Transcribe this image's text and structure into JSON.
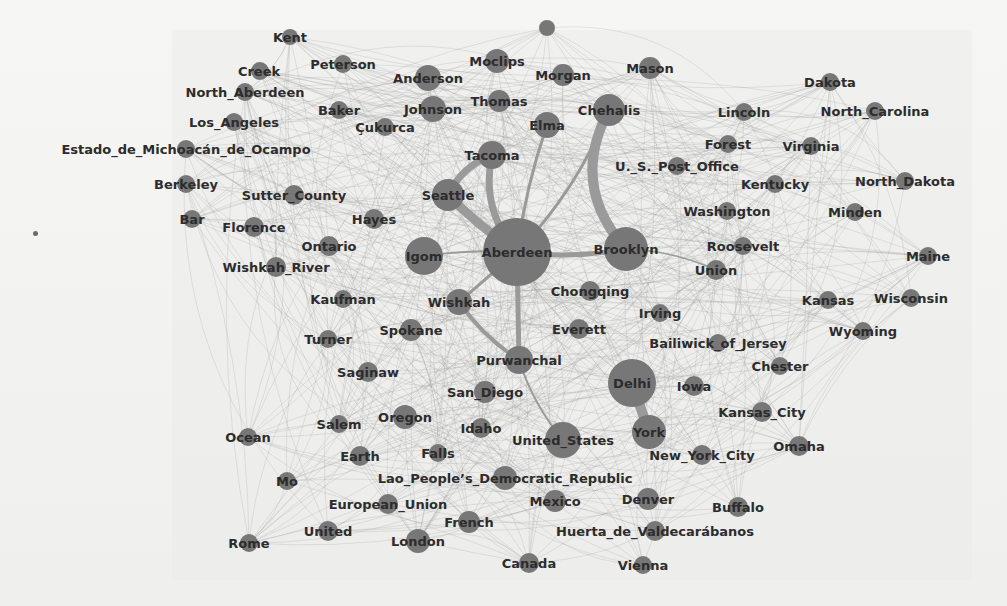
{
  "figure": {
    "type": "network-graph",
    "colors": {
      "node": "#777777",
      "edge": "#9a9a9a",
      "label": "#2c2c2c",
      "background": "#f1f1ef"
    }
  },
  "nodes": [
    {
      "id": "Kent",
      "x": 290,
      "y": 37,
      "r": 8,
      "lx": 290,
      "ly": 42
    },
    {
      "id": "top_unlabeled",
      "x": 547,
      "y": 28,
      "r": 8,
      "lx": 0,
      "ly": 0,
      "hidden_label": true
    },
    {
      "id": "Creek",
      "x": 260,
      "y": 71,
      "r": 9,
      "lx": 259,
      "ly": 76
    },
    {
      "id": "Peterson",
      "x": 343,
      "y": 64,
      "r": 9,
      "lx": 343,
      "ly": 69
    },
    {
      "id": "Anderson",
      "x": 428,
      "y": 78,
      "r": 13,
      "lx": 428,
      "ly": 83
    },
    {
      "id": "Moclips",
      "x": 497,
      "y": 61,
      "r": 12,
      "lx": 497,
      "ly": 66
    },
    {
      "id": "Morgan",
      "x": 563,
      "y": 75,
      "r": 11,
      "lx": 563,
      "ly": 80
    },
    {
      "id": "Mason",
      "x": 650,
      "y": 68,
      "r": 11,
      "lx": 650,
      "ly": 73
    },
    {
      "id": "Dakota",
      "x": 830,
      "y": 82,
      "r": 9,
      "lx": 830,
      "ly": 87
    },
    {
      "id": "North_Aberdeen",
      "x": 245,
      "y": 92,
      "r": 9,
      "lx": 245,
      "ly": 97
    },
    {
      "id": "Baker",
      "x": 339,
      "y": 110,
      "r": 9,
      "lx": 339,
      "ly": 115
    },
    {
      "id": "Johnson",
      "x": 433,
      "y": 109,
      "r": 13,
      "lx": 433,
      "ly": 114
    },
    {
      "id": "Thomas",
      "x": 499,
      "y": 101,
      "r": 11,
      "lx": 499,
      "ly": 106
    },
    {
      "id": "Chehalis",
      "x": 609,
      "y": 110,
      "r": 16,
      "lx": 609,
      "ly": 115
    },
    {
      "id": "Lincoln",
      "x": 744,
      "y": 112,
      "r": 9,
      "lx": 744,
      "ly": 117
    },
    {
      "id": "North_Carolina",
      "x": 875,
      "y": 111,
      "r": 9,
      "lx": 875,
      "ly": 116
    },
    {
      "id": "Los_Angeles",
      "x": 234,
      "y": 122,
      "r": 9,
      "lx": 234,
      "ly": 127
    },
    {
      "id": "Çukurca",
      "x": 385,
      "y": 127,
      "r": 9,
      "lx": 385,
      "ly": 132
    },
    {
      "id": "Elma",
      "x": 547,
      "y": 125,
      "r": 13,
      "lx": 547,
      "ly": 130
    },
    {
      "id": "Forest",
      "x": 728,
      "y": 144,
      "r": 9,
      "lx": 728,
      "ly": 149
    },
    {
      "id": "Virginia",
      "x": 811,
      "y": 146,
      "r": 9,
      "lx": 811,
      "ly": 151
    },
    {
      "id": "Estado_de_Michoacán_de_Ocampo",
      "x": 186,
      "y": 149,
      "r": 9,
      "lx": 186,
      "ly": 154
    },
    {
      "id": "Tacoma",
      "x": 492,
      "y": 155,
      "r": 14,
      "lx": 492,
      "ly": 160
    },
    {
      "id": "U._S._Post_Office",
      "x": 677,
      "y": 166,
      "r": 9,
      "lx": 677,
      "ly": 171
    },
    {
      "id": "Berkeley",
      "x": 186,
      "y": 184,
      "r": 9,
      "lx": 186,
      "ly": 189
    },
    {
      "id": "Kentucky",
      "x": 775,
      "y": 184,
      "r": 9,
      "lx": 775,
      "ly": 189
    },
    {
      "id": "North_Dakota",
      "x": 905,
      "y": 181,
      "r": 9,
      "lx": 905,
      "ly": 186
    },
    {
      "id": "Sutter_County",
      "x": 294,
      "y": 195,
      "r": 10,
      "lx": 294,
      "ly": 200
    },
    {
      "id": "Seattle",
      "x": 448,
      "y": 195,
      "r": 16,
      "lx": 448,
      "ly": 200
    },
    {
      "id": "Washington",
      "x": 727,
      "y": 211,
      "r": 9,
      "lx": 727,
      "ly": 216
    },
    {
      "id": "Minden",
      "x": 855,
      "y": 212,
      "r": 9,
      "lx": 855,
      "ly": 217
    },
    {
      "id": "Bar",
      "x": 192,
      "y": 219,
      "r": 9,
      "lx": 192,
      "ly": 224
    },
    {
      "id": "Florence",
      "x": 254,
      "y": 227,
      "r": 10,
      "lx": 254,
      "ly": 232
    },
    {
      "id": "Hayes",
      "x": 374,
      "y": 219,
      "r": 10,
      "lx": 374,
      "ly": 224
    },
    {
      "id": "Ontario",
      "x": 329,
      "y": 246,
      "r": 10,
      "lx": 329,
      "ly": 251
    },
    {
      "id": "Igom",
      "x": 424,
      "y": 256,
      "r": 19,
      "lx": 424,
      "ly": 261
    },
    {
      "id": "Aberdeen",
      "x": 517,
      "y": 252,
      "r": 34,
      "lx": 517,
      "ly": 257
    },
    {
      "id": "Brooklyn",
      "x": 626,
      "y": 249,
      "r": 22,
      "lx": 626,
      "ly": 254
    },
    {
      "id": "Roosevelt",
      "x": 743,
      "y": 246,
      "r": 9,
      "lx": 743,
      "ly": 251
    },
    {
      "id": "Maine",
      "x": 928,
      "y": 256,
      "r": 9,
      "lx": 928,
      "ly": 261
    },
    {
      "id": "Wishkah_River",
      "x": 276,
      "y": 267,
      "r": 10,
      "lx": 276,
      "ly": 272
    },
    {
      "id": "Union",
      "x": 716,
      "y": 270,
      "r": 10,
      "lx": 716,
      "ly": 275
    },
    {
      "id": "Chongqing",
      "x": 590,
      "y": 291,
      "r": 10,
      "lx": 590,
      "ly": 296
    },
    {
      "id": "Kaufman",
      "x": 343,
      "y": 299,
      "r": 9,
      "lx": 343,
      "ly": 304
    },
    {
      "id": "Wishkah",
      "x": 459,
      "y": 302,
      "r": 13,
      "lx": 459,
      "ly": 307
    },
    {
      "id": "Kansas",
      "x": 828,
      "y": 300,
      "r": 9,
      "lx": 828,
      "ly": 305
    },
    {
      "id": "Wisconsin",
      "x": 911,
      "y": 298,
      "r": 9,
      "lx": 911,
      "ly": 303
    },
    {
      "id": "Irving",
      "x": 660,
      "y": 313,
      "r": 9,
      "lx": 660,
      "ly": 318
    },
    {
      "id": "Turner",
      "x": 328,
      "y": 339,
      "r": 9,
      "lx": 328,
      "ly": 344
    },
    {
      "id": "Spokane",
      "x": 411,
      "y": 330,
      "r": 11,
      "lx": 411,
      "ly": 335
    },
    {
      "id": "Everett",
      "x": 579,
      "y": 329,
      "r": 10,
      "lx": 579,
      "ly": 334
    },
    {
      "id": "Wyoming",
      "x": 863,
      "y": 331,
      "r": 9,
      "lx": 863,
      "ly": 336
    },
    {
      "id": "Bailiwick_of_Jersey",
      "x": 718,
      "y": 343,
      "r": 9,
      "lx": 718,
      "ly": 348
    },
    {
      "id": "Purwanchal",
      "x": 519,
      "y": 360,
      "r": 14,
      "lx": 519,
      "ly": 365
    },
    {
      "id": "Chester",
      "x": 780,
      "y": 366,
      "r": 9,
      "lx": 780,
      "ly": 371
    },
    {
      "id": "Saginaw",
      "x": 368,
      "y": 372,
      "r": 10,
      "lx": 368,
      "ly": 377
    },
    {
      "id": "Delhi",
      "x": 632,
      "y": 383,
      "r": 24,
      "lx": 632,
      "ly": 388
    },
    {
      "id": "Iowa",
      "x": 694,
      "y": 386,
      "r": 10,
      "lx": 694,
      "ly": 391
    },
    {
      "id": "San_Diego",
      "x": 485,
      "y": 392,
      "r": 11,
      "lx": 485,
      "ly": 397
    },
    {
      "id": "Kansas_City",
      "x": 762,
      "y": 412,
      "r": 10,
      "lx": 762,
      "ly": 417
    },
    {
      "id": "Salem",
      "x": 339,
      "y": 424,
      "r": 9,
      "lx": 339,
      "ly": 429
    },
    {
      "id": "Oregon",
      "x": 405,
      "y": 417,
      "r": 12,
      "lx": 405,
      "ly": 422
    },
    {
      "id": "Idaho",
      "x": 481,
      "y": 428,
      "r": 10,
      "lx": 481,
      "ly": 433
    },
    {
      "id": "United_States",
      "x": 563,
      "y": 440,
      "r": 18,
      "lx": 563,
      "ly": 445
    },
    {
      "id": "York",
      "x": 649,
      "y": 432,
      "r": 17,
      "lx": 649,
      "ly": 437
    },
    {
      "id": "Ocean",
      "x": 248,
      "y": 437,
      "r": 9,
      "lx": 248,
      "ly": 442
    },
    {
      "id": "Omaha",
      "x": 799,
      "y": 446,
      "r": 10,
      "lx": 799,
      "ly": 451
    },
    {
      "id": "New_York_City",
      "x": 702,
      "y": 455,
      "r": 10,
      "lx": 702,
      "ly": 460
    },
    {
      "id": "Earth",
      "x": 360,
      "y": 456,
      "r": 10,
      "lx": 360,
      "ly": 461
    },
    {
      "id": "Falls",
      "x": 438,
      "y": 453,
      "r": 9,
      "lx": 438,
      "ly": 458
    },
    {
      "id": "Lao_People’s_Democratic_Republic",
      "x": 505,
      "y": 478,
      "r": 12,
      "lx": 505,
      "ly": 483
    },
    {
      "id": "Mo",
      "x": 287,
      "y": 481,
      "r": 9,
      "lx": 287,
      "ly": 486
    },
    {
      "id": "European_Union",
      "x": 388,
      "y": 504,
      "r": 10,
      "lx": 388,
      "ly": 509
    },
    {
      "id": "Mexico",
      "x": 555,
      "y": 501,
      "r": 11,
      "lx": 555,
      "ly": 506
    },
    {
      "id": "Denver",
      "x": 648,
      "y": 499,
      "r": 11,
      "lx": 648,
      "ly": 504
    },
    {
      "id": "Buffalo",
      "x": 738,
      "y": 507,
      "r": 10,
      "lx": 738,
      "ly": 512
    },
    {
      "id": "French",
      "x": 469,
      "y": 522,
      "r": 11,
      "lx": 469,
      "ly": 527
    },
    {
      "id": "United",
      "x": 328,
      "y": 531,
      "r": 10,
      "lx": 328,
      "ly": 536
    },
    {
      "id": "Huerta_de_Valdecarábanos",
      "x": 655,
      "y": 531,
      "r": 10,
      "lx": 655,
      "ly": 536
    },
    {
      "id": "London",
      "x": 418,
      "y": 541,
      "r": 12,
      "lx": 418,
      "ly": 546
    },
    {
      "id": "Rome",
      "x": 249,
      "y": 543,
      "r": 9,
      "lx": 249,
      "ly": 548
    },
    {
      "id": "Canada",
      "x": 529,
      "y": 563,
      "r": 10,
      "lx": 529,
      "ly": 568
    },
    {
      "id": "Vienna",
      "x": 643,
      "y": 565,
      "r": 9,
      "lx": 643,
      "ly": 570
    }
  ],
  "strong_edges": [
    {
      "from": "Aberdeen",
      "to": "Brooklyn",
      "w": 5,
      "curve": 0.08
    },
    {
      "from": "Brooklyn",
      "to": "Chehalis",
      "w": 10,
      "curve": -0.35
    },
    {
      "from": "Aberdeen",
      "to": "Chehalis",
      "w": 3,
      "curve": 0.1
    },
    {
      "from": "Aberdeen",
      "to": "Tacoma",
      "w": 7,
      "curve": -0.25
    },
    {
      "from": "Aberdeen",
      "to": "Seattle",
      "w": 9,
      "curve": -0.05
    },
    {
      "from": "Seattle",
      "to": "Tacoma",
      "w": 7,
      "curve": -0.2
    },
    {
      "from": "Aberdeen",
      "to": "Elma",
      "w": 3,
      "curve": -0.05
    },
    {
      "from": "Aberdeen",
      "to": "Igom",
      "w": 2,
      "curve": 0.05
    },
    {
      "from": "Aberdeen",
      "to": "Wishkah",
      "w": 3,
      "curve": 0
    },
    {
      "from": "Aberdeen",
      "to": "Purwanchal",
      "w": 5,
      "curve": 0
    },
    {
      "from": "Wishkah",
      "to": "Purwanchal",
      "w": 4,
      "curve": 0.1
    },
    {
      "from": "Purwanchal",
      "to": "United_States",
      "w": 2,
      "curve": 0.1
    },
    {
      "from": "Delhi",
      "to": "York",
      "w": 10,
      "curve": 0
    },
    {
      "from": "Brooklyn",
      "to": "Union",
      "w": 1.5,
      "curve": -0.1
    }
  ],
  "stray_marks": [
    {
      "x": 35,
      "y": 233
    }
  ]
}
